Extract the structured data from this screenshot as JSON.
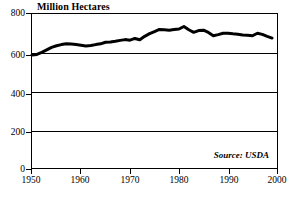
{
  "chart_data": {
    "type": "line",
    "title": "Million Hectares",
    "xlabel": "",
    "ylabel": "Million Hectares",
    "xlim": [
      1950,
      2000
    ],
    "ylim": [
      0,
      800
    ],
    "xticks": [
      1950,
      1960,
      1970,
      1980,
      1990,
      2000
    ],
    "xtick_labels": [
      "1950",
      "1960",
      "1970",
      "1980",
      "1990",
      "2000"
    ],
    "yticks": [
      0,
      200,
      400,
      600,
      800
    ],
    "ytick_labels": [
      "0",
      "200",
      "400",
      "600",
      "800"
    ],
    "grid": "horizontal",
    "gridlines_at": [
      200,
      400,
      600
    ],
    "legend": null,
    "annotations": [
      "Source: USDA"
    ],
    "source_note": "Source: USDA",
    "line_color": "#000000",
    "line_width_px": 3,
    "series": [
      {
        "name": "Grain Harvested Area",
        "x": [
          1950,
          1951,
          1952,
          1953,
          1954,
          1955,
          1956,
          1957,
          1958,
          1959,
          1960,
          1961,
          1962,
          1963,
          1964,
          1965,
          1966,
          1967,
          1968,
          1969,
          1970,
          1971,
          1972,
          1973,
          1974,
          1975,
          1976,
          1977,
          1978,
          1979,
          1980,
          1981,
          1982,
          1983,
          1984,
          1985,
          1986,
          1987,
          1988,
          1989,
          1990,
          1991,
          1992,
          1993,
          1994,
          1995,
          1996,
          1997,
          1998,
          1999
        ],
        "values": [
          587,
          590,
          601,
          614,
          627,
          635,
          641,
          645,
          644,
          641,
          638,
          634,
          636,
          641,
          645,
          653,
          655,
          658,
          663,
          667,
          664,
          673,
          666,
          684,
          698,
          709,
          720,
          718,
          716,
          719,
          722,
          735,
          718,
          705,
          714,
          716,
          704,
          687,
          693,
          700,
          700,
          697,
          695,
          691,
          690,
          687,
          700,
          694,
          684,
          675
        ]
      }
    ]
  },
  "axis": {
    "y_labels": [
      "800",
      "600",
      "400",
      "200",
      "0"
    ],
    "x_labels": [
      "1950",
      "1960",
      "1970",
      "1980",
      "1990",
      "2000"
    ]
  },
  "figure": {
    "title": "Million Hectares",
    "source": "Source: USDA"
  }
}
